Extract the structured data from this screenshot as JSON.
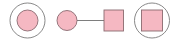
{
  "diagram": {
    "type": "pedigree-symbols",
    "colors": {
      "fill": "#f5b8c2",
      "shape_stroke": "#8a6a70",
      "ring_stroke": "#7a7a7a",
      "line": "#6f6f6f",
      "background": "#ffffff"
    },
    "nodes": [
      {
        "id": "n1",
        "shape": "circle",
        "ringed": true,
        "label": ""
      },
      {
        "id": "n2",
        "shape": "circle",
        "ringed": false,
        "label": ""
      },
      {
        "id": "n3",
        "shape": "square",
        "ringed": false,
        "label": ""
      },
      {
        "id": "n4",
        "shape": "square",
        "ringed": true,
        "label": ""
      }
    ],
    "edges": [
      {
        "from": "n2",
        "to": "n3"
      }
    ]
  }
}
